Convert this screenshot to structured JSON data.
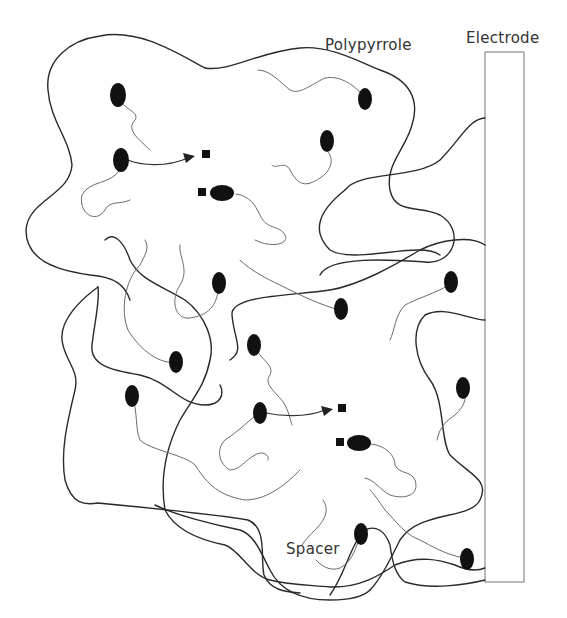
{
  "labels": {
    "polypyrrole": "Polypyrrole",
    "electrode": "Electrode",
    "spacer": "Spacer"
  },
  "colors": {
    "background": "#ffffff",
    "chain": "#2a2a2a",
    "spacer": "#6a6a6a",
    "redox_site": "#111111",
    "electrode_outline": "#777777",
    "label_text": "#333333"
  },
  "diagram": {
    "type": "schematic",
    "description_elements": [
      "polypyrrole-chains",
      "redox-sites",
      "spacers",
      "counter-ions",
      "electron-transfer-arrows",
      "electrode"
    ]
  }
}
